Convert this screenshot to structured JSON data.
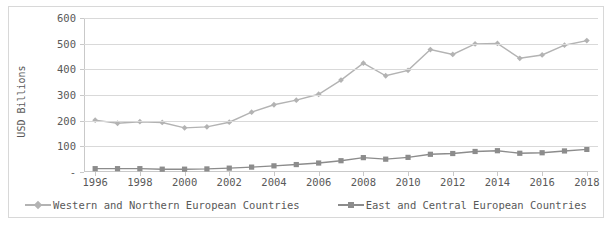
{
  "chart_data": {
    "type": "line",
    "title": "",
    "xlabel": "",
    "ylabel": "USD Billions",
    "x": [
      1996,
      1997,
      1998,
      1999,
      2000,
      2001,
      2002,
      2003,
      2004,
      2005,
      2006,
      2007,
      2008,
      2009,
      2010,
      2011,
      2012,
      2013,
      2014,
      2015,
      2016,
      2017,
      2018
    ],
    "xlim": [
      1995.5,
      2018.5
    ],
    "ylim": [
      0,
      600
    ],
    "yticks": [
      0,
      100,
      200,
      300,
      400,
      500,
      600
    ],
    "ytick_labels": [
      "-",
      "100",
      "200",
      "300",
      "400",
      "500",
      "600"
    ],
    "xtick_labels": [
      "1996",
      "1998",
      "2000",
      "2002",
      "2004",
      "2006",
      "2008",
      "2010",
      "2012",
      "2014",
      "2016",
      "2018"
    ],
    "xticks": [
      1996,
      1998,
      2000,
      2002,
      2004,
      2006,
      2008,
      2010,
      2012,
      2014,
      2016,
      2018
    ],
    "grid": "horizontal",
    "legend_position": "bottom",
    "series": [
      {
        "name": "Western and Northern European Countries",
        "color": "#b3b3b3",
        "marker": "diamond",
        "values": [
          202,
          190,
          196,
          193,
          172,
          176,
          194,
          233,
          262,
          280,
          303,
          358,
          424,
          375,
          396,
          477,
          458,
          499,
          501,
          443,
          456,
          494,
          512
        ]
      },
      {
        "name": "East and Central European Countries",
        "color": "#8c8c8c",
        "marker": "square",
        "values": [
          13,
          13,
          13,
          11,
          11,
          12,
          15,
          19,
          24,
          29,
          35,
          44,
          56,
          50,
          57,
          69,
          72,
          80,
          83,
          73,
          75,
          82,
          88
        ]
      }
    ]
  },
  "axis": {
    "y_title": "USD Billions"
  },
  "legend": {
    "entries": [
      {
        "label": "Western and Northern European Countries",
        "marker": "diamond-marker",
        "color": "#b3b3b3"
      },
      {
        "label": "East and Central European Countries",
        "marker": "square-marker",
        "color": "#8c8c8c"
      }
    ]
  }
}
